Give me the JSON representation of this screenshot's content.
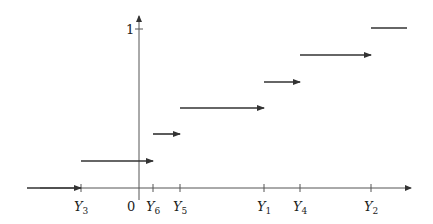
{
  "chart_data": {
    "type": "line",
    "title": "",
    "xlabel": "",
    "ylabel": "",
    "x_tick_labels": [
      "Y3",
      "0",
      "Y6",
      "Y5",
      "Y1",
      "Y4",
      "Y2"
    ],
    "y_tick_labels": [
      "1"
    ],
    "order_statistics": [
      "Y3",
      "Y6",
      "Y5",
      "Y1",
      "Y4",
      "Y2"
    ],
    "steps": [
      {
        "from": "-inf",
        "to": "Y3",
        "value": 0
      },
      {
        "from": "Y3",
        "to": "Y6",
        "value": 0.1667
      },
      {
        "from": "Y6",
        "to": "Y5",
        "value": 0.3333
      },
      {
        "from": "Y5",
        "to": "Y1",
        "value": 0.5
      },
      {
        "from": "Y1",
        "to": "Y4",
        "value": 0.6667
      },
      {
        "from": "Y4",
        "to": "Y2",
        "value": 0.8333
      },
      {
        "from": "Y2",
        "to": "+inf",
        "value": 1
      }
    ],
    "ylim": [
      0,
      1
    ],
    "grid": false,
    "legend": null
  },
  "axis": {
    "origin_label": "0",
    "y_one_label": "1",
    "ticks": [
      {
        "main": "Y",
        "sub": "3",
        "x": 81
      },
      {
        "main": "Y",
        "sub": "6",
        "x": 153
      },
      {
        "main": "Y",
        "sub": "5",
        "x": 180
      },
      {
        "main": "Y",
        "sub": "1",
        "x": 264
      },
      {
        "main": "Y",
        "sub": "4",
        "x": 300
      },
      {
        "main": "Y",
        "sub": "2",
        "x": 371
      }
    ]
  },
  "geometry": {
    "x_axis_y": 188,
    "y_axis_x": 139,
    "segments": [
      {
        "x1": 27,
        "x2": 81,
        "y": 188,
        "arrow": true
      },
      {
        "x1": 81,
        "x2": 153,
        "y": 161,
        "arrow": true
      },
      {
        "x1": 153,
        "x2": 180,
        "y": 134,
        "arrow": true
      },
      {
        "x1": 180,
        "x2": 264,
        "y": 108,
        "arrow": true
      },
      {
        "x1": 264,
        "x2": 300,
        "y": 82,
        "arrow": true
      },
      {
        "x1": 300,
        "x2": 371,
        "y": 55,
        "arrow": true
      },
      {
        "x1": 371,
        "x2": 407,
        "y": 28,
        "arrow": false
      }
    ],
    "color": "#333333"
  }
}
